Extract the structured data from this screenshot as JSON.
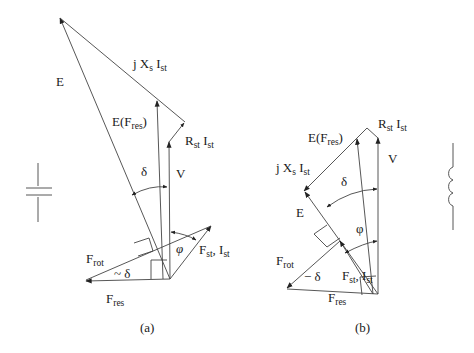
{
  "figure": {
    "panel_a": {
      "caption": "(a)",
      "labels": {
        "E": "E",
        "jXsIst_j": "j X",
        "jXsIst_s": "s",
        "jXsIst_I": " I",
        "jXsIst_st": "st",
        "EFres_E": "E(F",
        "EFres_res": "res",
        "EFres_close": ")",
        "RstIst_R": "R",
        "RstIst_st1": "st",
        "RstIst_I": " I",
        "RstIst_st2": "st",
        "delta": "δ",
        "V": "V",
        "phi": "φ",
        "FstIst_F": "F",
        "FstIst_st1": "st",
        "FstIst_I": ", I",
        "FstIst_st2": "st",
        "Frot_F": "F",
        "Frot_rot": "rot",
        "minus_delta": "~ δ",
        "Fres_F": "F",
        "Fres_res": "res"
      },
      "symbol": "capacitor"
    },
    "panel_b": {
      "caption": "(b)",
      "labels": {
        "EFres_E": "E(F",
        "EFres_res": "res",
        "EFres_close": ")",
        "RstIst_R": "R",
        "RstIst_st1": "st",
        "RstIst_I": " I",
        "RstIst_st2": "st",
        "jXsIst_j": "j X",
        "jXsIst_s": "s",
        "jXsIst_I": " I",
        "jXsIst_st": "st",
        "V": "V",
        "delta": "δ",
        "E": "E",
        "phi": "φ",
        "Frot_F": "F",
        "Frot_rot": "rot",
        "minus_delta": "− δ",
        "FstIst_F": "F",
        "FstIst_st1": "st",
        "FstIst_I": ", I",
        "FstIst_st2": "st",
        "Fres_F": "F",
        "Fres_res": "res"
      },
      "symbol": "inductor"
    }
  }
}
